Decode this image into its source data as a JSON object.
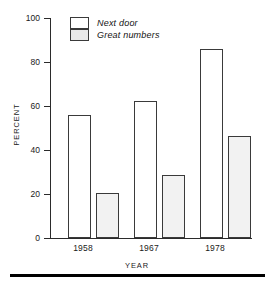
{
  "chart_data": {
    "type": "bar",
    "title": "",
    "subtitle": "",
    "xlabel": "YEAR",
    "ylabel": "PERCENT",
    "categories": [
      "1958",
      "1967",
      "1978"
    ],
    "series": [
      {
        "name": "Next door",
        "values": [
          56,
          62.5,
          86
        ],
        "fill": "open"
      },
      {
        "name": "Great numbers",
        "values": [
          20.5,
          28.5,
          46.5
        ],
        "fill": "hatched"
      }
    ],
    "ylim": [
      0,
      100
    ],
    "yticks": [
      0,
      20,
      40,
      60,
      80,
      100
    ],
    "ytick_labels": [
      "0",
      "20",
      "40",
      "60",
      "80",
      "100"
    ],
    "grid": false,
    "legend_position": "top-left-inside",
    "legend_italic": true
  },
  "axes": {
    "y_title": "PERCENT",
    "x_title": "YEAR",
    "y_tick_labels": [
      "100",
      "80",
      "60",
      "40",
      "20",
      "0"
    ],
    "x_tick_labels": [
      "1958",
      "1967",
      "1978"
    ]
  },
  "legend": {
    "entries": [
      {
        "label": "Next door",
        "swatch": "open-white-box"
      },
      {
        "label": "Great numbers",
        "swatch": "hatched-gray-box"
      }
    ]
  },
  "colors": {
    "axis": "#2b2b2b",
    "bar_outline": "#3a3a3a",
    "bar_open_fill": "#ffffff",
    "bar_hatched_fill": "#ececec",
    "rule": "#000000",
    "text": "#1a1a1a"
  }
}
